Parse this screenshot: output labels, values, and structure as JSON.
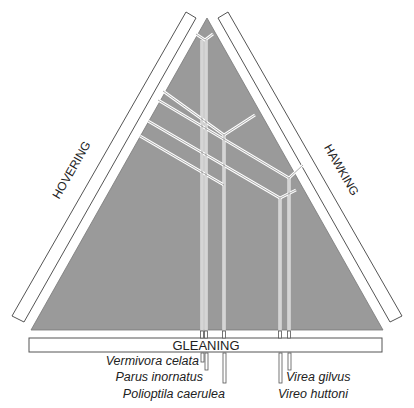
{
  "diagram": {
    "type": "ternary foraging-mode triangle",
    "axes": {
      "left": "HOVERING",
      "right": "HAWKING",
      "bottom": "GLEANING"
    },
    "colors": {
      "fill": "#9a9a9a",
      "line": "#ffffff",
      "stroke": "#555555"
    },
    "species": [
      {
        "name": "Vermivora celata",
        "side": "left"
      },
      {
        "name": "Parus inornatus",
        "side": "left"
      },
      {
        "name": "Polioptila caerulea",
        "side": "left"
      },
      {
        "name": "Virea gilvus",
        "side": "right"
      },
      {
        "name": "Vireo huttoni",
        "side": "right"
      }
    ]
  }
}
